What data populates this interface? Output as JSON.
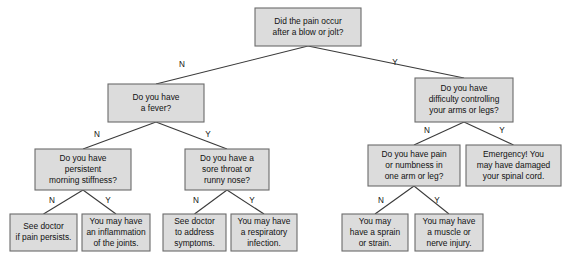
{
  "diagram": {
    "type": "decision-tree",
    "style": {
      "node_fill": "#dcdcdc",
      "node_border": "#6b6b6b",
      "edge_color": "#3a3a3a",
      "text_color": "#111111",
      "background": "#ffffff"
    },
    "nodes": [
      {
        "id": "root",
        "kind": "question",
        "lines": [
          "Did the pain occur",
          "after a blow or jolt?"
        ],
        "x": 255,
        "y": 8,
        "w": 106,
        "h": 38
      },
      {
        "id": "fever",
        "kind": "question",
        "lines": [
          "Do you have",
          "a fever?"
        ],
        "x": 108,
        "y": 84,
        "w": 96,
        "h": 38
      },
      {
        "id": "difficulty",
        "kind": "question",
        "lines": [
          "Do you have",
          "difficulty controlling",
          "your arms or legs?"
        ],
        "x": 415,
        "y": 78,
        "w": 98,
        "h": 44
      },
      {
        "id": "stiffness",
        "kind": "question",
        "lines": [
          "Do you have",
          "persistent",
          "morning stiffness?"
        ],
        "x": 35,
        "y": 149,
        "w": 96,
        "h": 41
      },
      {
        "id": "sorethroat",
        "kind": "question",
        "lines": [
          "Do you have a",
          "sore throat or",
          "runny nose?"
        ],
        "x": 185,
        "y": 149,
        "w": 84,
        "h": 41
      },
      {
        "id": "numbness",
        "kind": "question",
        "lines": [
          "Do you have pain",
          "or numbness in",
          "one arm or leg?"
        ],
        "x": 368,
        "y": 145,
        "w": 92,
        "h": 41
      },
      {
        "id": "emergency",
        "kind": "outcome",
        "lines": [
          "Emergency! You",
          "may have damaged",
          "your spinal cord."
        ],
        "x": 466,
        "y": 145,
        "w": 95,
        "h": 41
      },
      {
        "id": "seedoctor-persists",
        "kind": "outcome",
        "lines": [
          "See doctor",
          "if pain persists."
        ],
        "x": 10,
        "y": 214,
        "w": 67,
        "h": 37
      },
      {
        "id": "inflammation",
        "kind": "outcome",
        "lines": [
          "You may have",
          "an inflammation",
          "of the joints."
        ],
        "x": 82,
        "y": 214,
        "w": 68,
        "h": 37
      },
      {
        "id": "seedoctor-symptoms",
        "kind": "outcome",
        "lines": [
          "See doctor",
          "to address",
          "symptoms."
        ],
        "x": 163,
        "y": 214,
        "w": 63,
        "h": 37
      },
      {
        "id": "respiratory",
        "kind": "outcome",
        "lines": [
          "You may have",
          "a respiratory",
          "infection."
        ],
        "x": 231,
        "y": 214,
        "w": 66,
        "h": 37
      },
      {
        "id": "sprain",
        "kind": "outcome",
        "lines": [
          "You may",
          "have a sprain",
          "or strain."
        ],
        "x": 342,
        "y": 214,
        "w": 66,
        "h": 37
      },
      {
        "id": "muscle-nerve",
        "kind": "outcome",
        "lines": [
          "You may have",
          "a muscle or",
          "nerve injury."
        ],
        "x": 415,
        "y": 214,
        "w": 68,
        "h": 37
      }
    ],
    "edges": [
      {
        "id": "root-no",
        "from": "root",
        "to": "fever",
        "label": "N",
        "lx": 182,
        "ly": 65
      },
      {
        "id": "root-yes",
        "from": "root",
        "to": "difficulty",
        "label": "Y",
        "lx": 395,
        "ly": 63
      },
      {
        "id": "fever-no",
        "from": "fever",
        "to": "stiffness",
        "label": "N",
        "lx": 97,
        "ly": 135
      },
      {
        "id": "fever-yes",
        "from": "fever",
        "to": "sorethroat",
        "label": "Y",
        "lx": 208,
        "ly": 135
      },
      {
        "id": "diff-no",
        "from": "difficulty",
        "to": "numbness",
        "label": "N",
        "lx": 427,
        "ly": 131
      },
      {
        "id": "diff-yes",
        "from": "difficulty",
        "to": "emergency",
        "label": "Y",
        "lx": 502,
        "ly": 131
      },
      {
        "id": "stiff-no",
        "from": "stiffness",
        "to": "seedoctor-persists",
        "label": "N",
        "lx": 52,
        "ly": 201
      },
      {
        "id": "stiff-yes",
        "from": "stiffness",
        "to": "inflammation",
        "label": "Y",
        "lx": 108,
        "ly": 201
      },
      {
        "id": "sore-no",
        "from": "sorethroat",
        "to": "seedoctor-symptoms",
        "label": "N",
        "lx": 196,
        "ly": 201
      },
      {
        "id": "sore-yes",
        "from": "sorethroat",
        "to": "respiratory",
        "label": "Y",
        "lx": 252,
        "ly": 201
      },
      {
        "id": "numb-no",
        "from": "numbness",
        "to": "sprain",
        "label": "N",
        "lx": 381,
        "ly": 201
      },
      {
        "id": "numb-yes",
        "from": "numbness",
        "to": "muscle-nerve",
        "label": "Y",
        "lx": 437,
        "ly": 201
      }
    ]
  }
}
